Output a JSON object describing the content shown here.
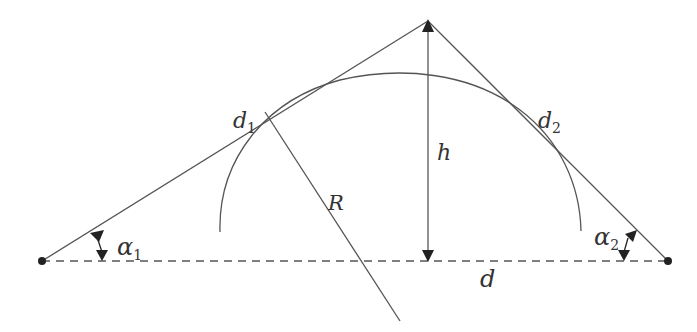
{
  "diagram": {
    "type": "geometry",
    "colors": {
      "line": "#555555",
      "arrow": "#222222",
      "text": "#333333",
      "background": "#ffffff"
    },
    "labels": {
      "d1": {
        "base": "d",
        "sub": "1"
      },
      "d2": {
        "base": "d",
        "sub": "2"
      },
      "h": "h",
      "R": "R",
      "d": "d",
      "alpha1": {
        "base": "α",
        "sub": "1"
      },
      "alpha2": {
        "base": "α",
        "sub": "2"
      }
    },
    "points": {
      "left_end": [
        42,
        261
      ],
      "right_end": [
        668,
        261
      ],
      "apex": [
        428,
        21
      ],
      "apex_foot": [
        428,
        261
      ]
    }
  }
}
